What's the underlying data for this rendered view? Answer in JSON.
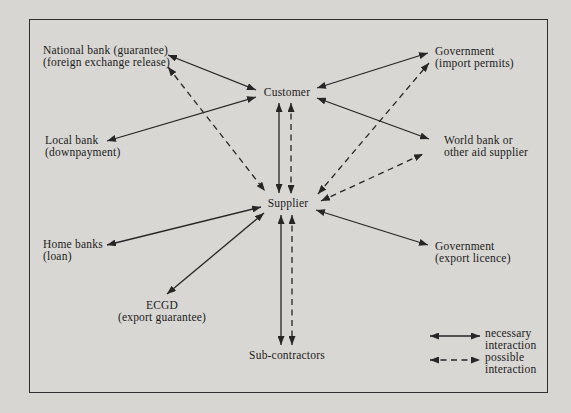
{
  "canvas": {
    "background": "#d7d6d2",
    "border_color": "#2e2e2e",
    "line_color": "#262626",
    "text_color": "#1b1b1b"
  },
  "nodes": [
    {
      "id": "national-bank",
      "lines": [
        "National bank (guarantee)",
        "(foreign exchange release)"
      ]
    },
    {
      "id": "government-import",
      "lines": [
        "Government",
        "(import permits)"
      ]
    },
    {
      "id": "customer",
      "lines": [
        "Customer"
      ]
    },
    {
      "id": "local-bank",
      "lines": [
        "Local bank",
        "(downpayment)"
      ]
    },
    {
      "id": "world-bank",
      "lines": [
        "World bank or",
        "other aid supplier"
      ]
    },
    {
      "id": "supplier",
      "lines": [
        "Supplier"
      ]
    },
    {
      "id": "home-banks",
      "lines": [
        "Home banks",
        "(loan)"
      ]
    },
    {
      "id": "ecgd",
      "lines": [
        "ECGD",
        "(export guarantee)"
      ]
    },
    {
      "id": "government-export",
      "lines": [
        "Government",
        "(export licence)"
      ]
    },
    {
      "id": "sub-contractors",
      "lines": [
        "Sub-contractors"
      ]
    }
  ],
  "edges": [
    {
      "from": "national-bank",
      "to": "customer",
      "type": "necessary",
      "x1": 168,
      "y1": 55,
      "x2": 256,
      "y2": 90
    },
    {
      "from": "local-bank",
      "to": "customer",
      "type": "necessary",
      "x1": 107,
      "y1": 141,
      "x2": 256,
      "y2": 97
    },
    {
      "from": "customer",
      "to": "government-import",
      "type": "necessary",
      "x1": 317,
      "y1": 88,
      "x2": 428,
      "y2": 53
    },
    {
      "from": "customer",
      "to": "world-bank",
      "type": "necessary",
      "x1": 317,
      "y1": 98,
      "x2": 429,
      "y2": 139
    },
    {
      "from": "customer",
      "to": "supplier",
      "type": "necessary",
      "x1": 279,
      "y1": 103,
      "x2": 279,
      "y2": 193
    },
    {
      "from": "supplier",
      "to": "home-banks",
      "type": "necessary",
      "x1": 261,
      "y1": 207,
      "x2": 107,
      "y2": 245
    },
    {
      "from": "supplier",
      "to": "ecgd",
      "type": "necessary",
      "x1": 264,
      "y1": 213,
      "x2": 167,
      "y2": 294
    },
    {
      "from": "supplier",
      "to": "government-export",
      "type": "necessary",
      "x1": 316,
      "y1": 210,
      "x2": 428,
      "y2": 245
    },
    {
      "from": "supplier",
      "to": "sub-contractors",
      "type": "necessary",
      "x1": 281,
      "y1": 215,
      "x2": 281,
      "y2": 345
    },
    {
      "from": "national-bank",
      "to": "supplier",
      "type": "possible",
      "x1": 168,
      "y1": 67,
      "x2": 265,
      "y2": 191
    },
    {
      "from": "customer",
      "to": "supplier",
      "type": "possible",
      "x1": 291,
      "y1": 103,
      "x2": 291,
      "y2": 194
    },
    {
      "from": "supplier",
      "to": "government-import",
      "type": "possible",
      "x1": 318,
      "y1": 194,
      "x2": 429,
      "y2": 63
    },
    {
      "from": "supplier",
      "to": "world-bank",
      "type": "possible",
      "x1": 321,
      "y1": 201,
      "x2": 423,
      "y2": 154
    },
    {
      "from": "supplier",
      "to": "sub-contractors",
      "type": "possible",
      "x1": 292,
      "y1": 215,
      "x2": 292,
      "y2": 345
    }
  ],
  "legend": {
    "items": [
      {
        "type": "necessary",
        "lines": [
          "necessary",
          "interaction"
        ],
        "arrow": {
          "x1": 430,
          "y1": 336,
          "x2": 480,
          "y2": 336
        }
      },
      {
        "type": "possible",
        "lines": [
          "possible",
          "interaction"
        ],
        "arrow": {
          "x1": 430,
          "y1": 360,
          "x2": 480,
          "y2": 360
        }
      }
    ]
  }
}
